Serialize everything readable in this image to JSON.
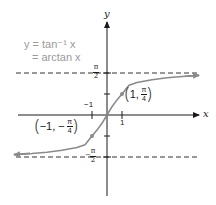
{
  "figure": {
    "function_label_line1": "y = tan⁻¹ x",
    "function_label_line2": "= arctan x",
    "x_axis_label": "x",
    "y_axis_label": "y",
    "tick_x_pos": "1",
    "tick_y_neg": "−1",
    "asymptote_upper": {
      "num": "π",
      "den": "2",
      "sign": ""
    },
    "asymptote_lower": {
      "num": "π",
      "den": "2",
      "sign": "−"
    },
    "point_pos": {
      "x": "1,",
      "num": "π",
      "den": "4"
    },
    "point_neg": {
      "x": "−1, −",
      "num": "π",
      "den": "4"
    },
    "colors": {
      "curve": "#8a8a8a",
      "axes": "#1a1a1a",
      "asymptote": "#333333",
      "label": "#9a9a9a"
    }
  }
}
